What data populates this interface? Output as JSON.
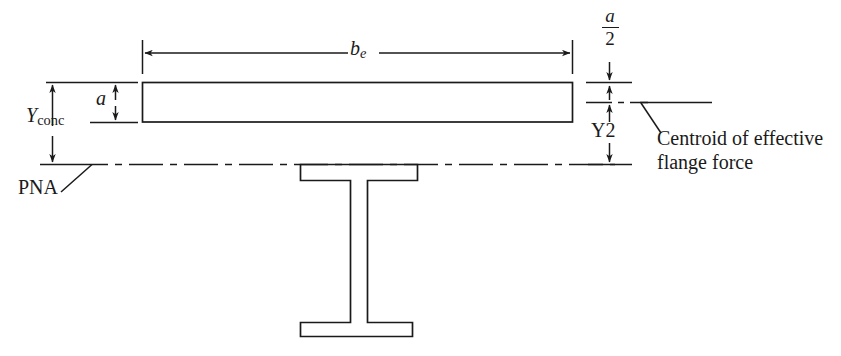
{
  "figure": {
    "type": "engineering-diagram",
    "background_color": "#ffffff",
    "line_color": "#1a1a1a"
  },
  "labels": {
    "effective_width": {
      "symbol": "b",
      "subscript": "e",
      "text": "b_e"
    },
    "slab_depth": {
      "symbol": "a",
      "text": "a"
    },
    "half_slab_depth": {
      "numerator": "a",
      "denominator": "2",
      "text": "a/2"
    },
    "concrete_depth": {
      "symbol": "Y",
      "subscript": "conc",
      "text": "Y_conc"
    },
    "y2": {
      "text": "Y2"
    },
    "pna": {
      "text": "PNA"
    },
    "centroid_note": {
      "line1": "Centroid of effective",
      "line2": "flange force"
    }
  },
  "geometry": {
    "slab": {
      "x": 142,
      "y": 82,
      "width": 431,
      "height": 40
    },
    "beam_top_flange": {
      "x": 300,
      "y": 164,
      "width": 117,
      "height": 16
    },
    "beam_web": {
      "x": 350,
      "y": 180,
      "width": 17,
      "height": 142
    },
    "beam_bottom_flange": {
      "x": 300,
      "y": 322,
      "width": 112,
      "height": 14
    },
    "pna_line_y": 164,
    "centroid_line_y": 102,
    "be_dimension_line_y": 53,
    "right_dimension_x": 609
  }
}
